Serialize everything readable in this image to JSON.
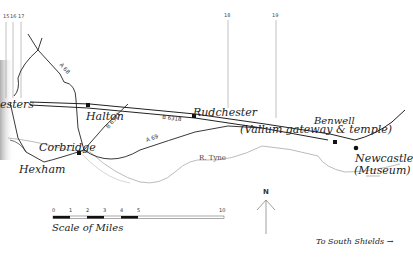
{
  "map": {
    "milecastles": [
      "15",
      "16",
      "17",
      "18",
      "19"
    ],
    "places": {
      "chesters": "esters",
      "halton": "Halton",
      "rudchester": "Rudchester",
      "rudchester_note": "(Vallum gateway & temple)",
      "benwell": "Benwell",
      "corbridge": "Corbridge",
      "hexham": "Hexham",
      "newcastle": "Newcastle",
      "newcastle_note": "(Museum)"
    },
    "roads": {
      "a68": "A 68",
      "a69": "A 69",
      "b6318": "B 6318",
      "b6321": "B 6321"
    },
    "river": "R. Tyne",
    "north_label": "N",
    "scale": {
      "ticks": [
        "0",
        "1",
        "2",
        "3",
        "4",
        "5",
        "10"
      ],
      "caption": "Scale of Miles"
    },
    "direction_note": "To South Shields →"
  }
}
